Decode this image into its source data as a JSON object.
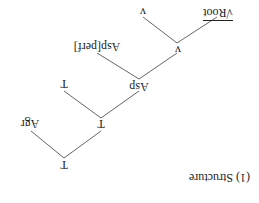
{
  "caption": "(1) Structure",
  "tree": {
    "nodes": [
      {
        "id": "t0",
        "label": "T"
      },
      {
        "id": "agr",
        "label": "Agr"
      },
      {
        "id": "t1",
        "label": "T"
      },
      {
        "id": "t2",
        "label": "T"
      },
      {
        "id": "asp",
        "label": "Asp"
      },
      {
        "id": "aspperf",
        "label": "Asp[perf]"
      },
      {
        "id": "v0",
        "label": "v"
      },
      {
        "id": "v1",
        "label": "v"
      },
      {
        "id": "root",
        "label": "√Root"
      }
    ],
    "edges": [
      [
        "t0",
        "agr"
      ],
      [
        "t0",
        "t1"
      ],
      [
        "t1",
        "t2"
      ],
      [
        "t1",
        "asp"
      ],
      [
        "asp",
        "aspperf"
      ],
      [
        "asp",
        "v0"
      ],
      [
        "v0",
        "v1"
      ],
      [
        "v0",
        "root"
      ]
    ]
  },
  "orientation": "rotated 180 degrees"
}
